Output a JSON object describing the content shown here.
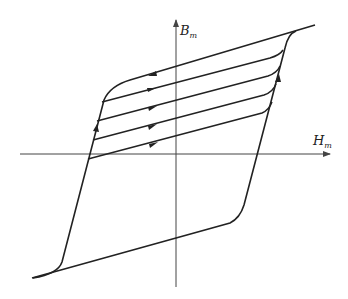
{
  "diagram": {
    "type": "hysteresis-loop",
    "axes": {
      "x_label": "H",
      "x_label_sub": "m",
      "y_label": "B",
      "y_label_sub": "m"
    },
    "colors": {
      "line": "#222222",
      "axis": "#444444",
      "background": "#ffffff"
    },
    "minor_loop_count": 4
  }
}
